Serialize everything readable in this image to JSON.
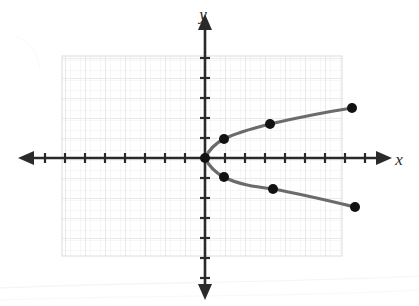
{
  "figure": {
    "kind": "coordinate-plane-graph",
    "background_color": "#ffffff",
    "grid_color": "#d8d8dc",
    "grid_minor_color": "#e9e9ee",
    "axis_color": "#2a2a2a",
    "curve_color": "#6b6b6b",
    "point_color": "#121212",
    "x_axis_label": "x",
    "y_axis_label": "y",
    "origin_px": {
      "x": 205,
      "y": 158
    },
    "unit_px": 20,
    "grid_bounds_px": {
      "left": 62,
      "top": 56,
      "right": 342,
      "bottom": 256
    },
    "x_axis_line_px": {
      "x1": 26,
      "x2": 384,
      "y": 158
    },
    "y_axis_line_px": {
      "y1": 22,
      "y2": 292,
      "x": 205
    },
    "x_tick_count": 17,
    "y_tick_count": 11,
    "tick_half_length_px": 5,
    "arrowheads": [
      "left",
      "right",
      "up",
      "down"
    ],
    "curve_stroke_width_px": 3.2,
    "point_radius_px": 5
  },
  "chart_data": {
    "type": "scatter",
    "title": "",
    "xlabel": "x",
    "ylabel": "y",
    "grid": true,
    "legend": null,
    "relation": "x = y^2  (y = ±√x)",
    "xlim": [
      -7,
      7
    ],
    "ylim": [
      -5,
      5
    ],
    "xticks": [
      -7,
      -6,
      -5,
      -4,
      -3,
      -2,
      -1,
      0,
      1,
      2,
      3,
      4,
      5,
      6,
      7
    ],
    "yticks": [
      -5,
      -4,
      -3,
      -2,
      -1,
      0,
      1,
      2,
      3,
      4,
      5
    ],
    "series": [
      {
        "name": "upper branch",
        "x": [
          0,
          1,
          3.25,
          7
        ],
        "y": [
          0,
          0.95,
          1.7,
          2.5
        ],
        "marker": "filled-circle",
        "line": "smooth"
      },
      {
        "name": "lower branch",
        "x": [
          0,
          1,
          3.4,
          7.5
        ],
        "y": [
          0,
          -0.95,
          -1.55,
          -2.45
        ],
        "marker": "filled-circle",
        "line": "smooth"
      }
    ],
    "points_px": [
      {
        "x": 205,
        "y": 158
      },
      {
        "x": 224,
        "y": 139
      },
      {
        "x": 270,
        "y": 124
      },
      {
        "x": 352,
        "y": 108
      },
      {
        "x": 224,
        "y": 177
      },
      {
        "x": 273,
        "y": 189
      },
      {
        "x": 355,
        "y": 207
      }
    ],
    "upper_path_px": "M 205 158 C 209 150 216 143 224 139 C 238 132 254 128 270 124 C 296 118 326 112 352 108",
    "lower_path_px": "M 205 158 C 209 166 216 173 224 177 C 239 185 257 187 273 189 C 301 194 330 201 355 207"
  }
}
